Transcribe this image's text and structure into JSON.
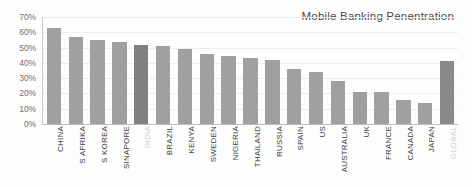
{
  "chart_data": {
    "type": "bar",
    "title": "Mobile Banking Penentration",
    "xlabel": "",
    "ylabel": "",
    "ylim": [
      0,
      70
    ],
    "grid": true,
    "legend": "none",
    "y_ticks": [
      "0%",
      "10%",
      "20%",
      "30%",
      "40%",
      "50%",
      "60%",
      "70%"
    ],
    "y_tick_values": [
      0,
      10,
      20,
      30,
      40,
      50,
      60,
      70
    ],
    "categories": [
      "CHINA",
      "S AFRIKA",
      "S KOREA",
      "SINAPORE",
      "INDIA",
      "BRAZIL",
      "KENYA",
      "SWEDEN",
      "NIGERIA",
      "THAILAND",
      "RUSSIA",
      "SPAIN",
      "US",
      "AUSTRALIA",
      "UK",
      "FRANCE",
      "CANADA",
      "JAPAN",
      "GLOBAL"
    ],
    "values": [
      63,
      57,
      55,
      53.5,
      52,
      51,
      49,
      45.5,
      44.5,
      43,
      42,
      36,
      34,
      28,
      21,
      21,
      16,
      14,
      41
    ],
    "bar_colors": [
      "#a0a0a0",
      "#a0a0a0",
      "#a0a0a0",
      "#a0a0a0",
      "#7f7f7f",
      "#a0a0a0",
      "#a0a0a0",
      "#a0a0a0",
      "#a0a0a0",
      "#a0a0a0",
      "#a0a0a0",
      "#a0a0a0",
      "#a0a0a0",
      "#a0a0a0",
      "#a0a0a0",
      "#a0a0a0",
      "#a0a0a0",
      "#a0a0a0",
      "#8a8a8a"
    ],
    "highlighted_categories": [
      "INDIA",
      "GLOBAL"
    ],
    "colors": {
      "bar_default": "#a0a0a0",
      "bar_emphasis": "#7f7f7f",
      "bar_total": "#8a8a8a",
      "grid": "#ececec",
      "axis": "#c4c4c4",
      "tick_text": "#6f6f6f",
      "title_text": "#4a4a4a",
      "label_text": "#3b3b3b",
      "label_on_bar": "#cfcfcf",
      "background": "#fdfdfd"
    }
  }
}
